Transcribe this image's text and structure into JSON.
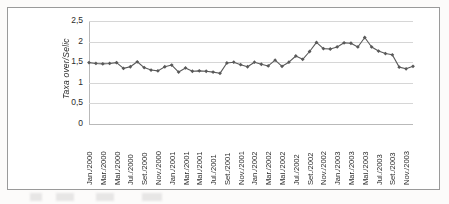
{
  "chart_data": {
    "type": "line",
    "title": "",
    "xlabel": "",
    "ylabel": "Taxa over/Selic",
    "ylim": [
      0,
      2.5
    ],
    "ytick_labels": [
      "2,5",
      "2",
      "1,5",
      "1",
      "0,5",
      "0"
    ],
    "ytick_values": [
      2.5,
      2.0,
      1.5,
      1.0,
      0.5,
      0.0
    ],
    "grid": true,
    "legend": "none",
    "series_color": "#595959",
    "marker": "diamond",
    "x_tick_labels": [
      "Jan./2000",
      "Mar./2000",
      "Mai./2000",
      "Jul./2000",
      "Set./2000",
      "Nov./2000",
      "Jan./2001",
      "Mar./2001",
      "Mai./2001",
      "Jul./2001",
      "Set./2001",
      "Nov./2001",
      "Jan./2002",
      "Mar./2002",
      "Mai./2002",
      "Jul./2002",
      "Set./2002",
      "Nov./2002",
      "Jan./2003",
      "Mar./2003",
      "Mai./2003",
      "Jul./2003",
      "Set./2003",
      "Nov./2003"
    ],
    "x": [
      "Jan./2000",
      "Fev./2000",
      "Mar./2000",
      "Abr./2000",
      "Mai./2000",
      "Jun./2000",
      "Jul./2000",
      "Ago./2000",
      "Set./2000",
      "Out./2000",
      "Nov./2000",
      "Dez./2000",
      "Jan./2001",
      "Fev./2001",
      "Mar./2001",
      "Abr./2001",
      "Mai./2001",
      "Jun./2001",
      "Jul./2001",
      "Ago./2001",
      "Set./2001",
      "Out./2001",
      "Nov./2001",
      "Dez./2001",
      "Jan./2002",
      "Fev./2002",
      "Mar./2002",
      "Abr./2002",
      "Mai./2002",
      "Jun./2002",
      "Jul./2002",
      "Ago./2002",
      "Set./2002",
      "Out./2002",
      "Nov./2002",
      "Dez./2002",
      "Jan./2003",
      "Fev./2003",
      "Mar./2003",
      "Abr./2003",
      "Mai./2003",
      "Jun./2003",
      "Jul./2003",
      "Ago./2003",
      "Set./2003",
      "Out./2003",
      "Nov./2003",
      "Dez./2003"
    ],
    "values": [
      1.49,
      1.47,
      1.46,
      1.47,
      1.49,
      1.35,
      1.39,
      1.51,
      1.37,
      1.31,
      1.29,
      1.39,
      1.43,
      1.26,
      1.36,
      1.28,
      1.29,
      1.28,
      1.26,
      1.23,
      1.23,
      1.2,
      1.21,
      1.02,
      1.25,
      1.28,
      1.19,
      1.28,
      1.35,
      1.38,
      1.27,
      1.31,
      1.42,
      1.6,
      1.54,
      1.37,
      1.46,
      1.56,
      1.42,
      1.47,
      1.42,
      1.44,
      1.55,
      1.46,
      1.35,
      1.27,
      1.32,
      1.41
    ],
    "values_tail": [
      1.48,
      1.5,
      1.44,
      1.39,
      1.5,
      1.45,
      1.41,
      1.55,
      1.4,
      1.5,
      1.65,
      1.57,
      1.76,
      1.98,
      1.83,
      1.82,
      1.87,
      1.97,
      1.96,
      1.87,
      2.1,
      1.87,
      1.77,
      1.71,
      1.68,
      1.38,
      1.34,
      1.4
    ],
    "min_value": 1.02,
    "max_value": 2.1,
    "n_points": 48
  },
  "chart": {
    "ytitle": "Taxa over/Selic"
  }
}
